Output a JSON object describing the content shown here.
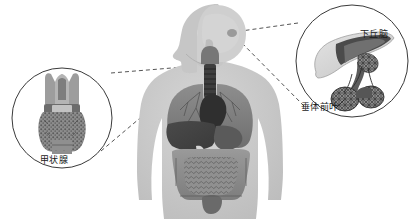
{
  "figure": {
    "type": "anatomical-diagram",
    "title": "",
    "background_color": "#ffffff",
    "palette": {
      "body_silhouette": "#c9c9c9",
      "body_outline": "#b0b0b0",
      "organ_mid": "#8a8a8a",
      "organ_dark": "#4a4a4a",
      "organ_darkest": "#333333",
      "organ_light": "#dcdcdc",
      "circle_stroke": "#3a3a3a",
      "dash_stroke": "#555555",
      "label_color": "#1a1a1a"
    }
  },
  "callouts": [
    {
      "id": "thyroid",
      "side": "left",
      "label": "甲状腺",
      "organ": "thyroid-gland",
      "circle": {
        "cx": 62,
        "cy": 118,
        "r": 50
      },
      "label_pos": {
        "x": 40,
        "y": 156
      }
    },
    {
      "id": "pituitary",
      "side": "right",
      "labels": [
        {
          "id": "hypothalamus",
          "text": "下丘脑",
          "x": 360,
          "y": 30
        },
        {
          "id": "anterior-pituitary",
          "text": "垂体前叶",
          "x": 301,
          "y": 103
        }
      ],
      "circle": {
        "cx": 352,
        "cy": 61,
        "r": 56
      }
    }
  ],
  "body": {
    "id": "human-torso",
    "view": "anterior with head in left profile",
    "organs": [
      "brain-region",
      "larynx-trachea",
      "lungs",
      "heart",
      "liver",
      "stomach",
      "small-intestine",
      "large-intestine"
    ]
  },
  "connectors": [
    {
      "id": "thyroid-upper",
      "from": [
        112,
        70
      ],
      "to": [
        196,
        66
      ]
    },
    {
      "id": "thyroid-lower",
      "from": [
        100,
        152
      ],
      "to": [
        196,
        70
      ]
    },
    {
      "id": "pituitary-upper",
      "from": [
        299,
        22
      ],
      "to": [
        233,
        32
      ]
    },
    {
      "id": "pituitary-lower",
      "from": [
        305,
        105
      ],
      "to": [
        233,
        34
      ]
    }
  ]
}
